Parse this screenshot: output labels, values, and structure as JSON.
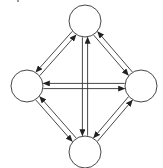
{
  "canvas": {
    "width": 163,
    "height": 168,
    "background": "#ffffff"
  },
  "style": {
    "stroke": "#333333",
    "node_fill": "#ffffff",
    "arrow_fill": "#222222"
  },
  "diagram": {
    "type": "directed-graph",
    "layout": "diamond",
    "node_radius": 16,
    "pair_offset": 2.6,
    "nodes": [
      {
        "id": "top",
        "label": "",
        "cx": 85,
        "cy": 21
      },
      {
        "id": "left",
        "label": "",
        "cx": 27,
        "cy": 86
      },
      {
        "id": "right",
        "label": "",
        "cx": 141,
        "cy": 86
      },
      {
        "id": "bottom",
        "label": "",
        "cx": 85,
        "cy": 152
      }
    ],
    "edges": [
      {
        "from": "left",
        "to": "top",
        "side": 1
      },
      {
        "from": "top",
        "to": "left",
        "side": 1
      },
      {
        "from": "top",
        "to": "right",
        "side": 1
      },
      {
        "from": "right",
        "to": "top",
        "side": 1
      },
      {
        "from": "left",
        "to": "bottom",
        "side": 1
      },
      {
        "from": "bottom",
        "to": "left",
        "side": 1
      },
      {
        "from": "bottom",
        "to": "right",
        "side": 1
      },
      {
        "from": "right",
        "to": "bottom",
        "side": 1
      },
      {
        "from": "top",
        "to": "bottom",
        "side": 1
      },
      {
        "from": "bottom",
        "to": "top",
        "side": 1
      },
      {
        "from": "right",
        "to": "left",
        "side": 1
      },
      {
        "from": "left",
        "to": "right",
        "side": 1
      }
    ]
  }
}
